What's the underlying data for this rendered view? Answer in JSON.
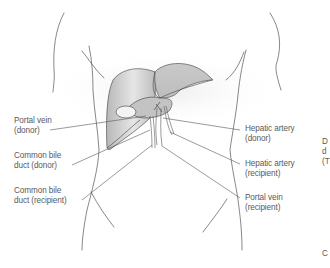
{
  "diagram": {
    "type": "anatomical",
    "colors": {
      "liver_fill": "#bdbdbd",
      "liver_stroke": "#555555",
      "body_outline": "#555555",
      "leader_line": "#555555",
      "text": "#5a5a5a",
      "shadow": "#efefef"
    },
    "labels_left": [
      {
        "line1": "Portal vein",
        "line2": "(donor)"
      },
      {
        "line1": "Common bile",
        "line2": "duct (donor)"
      },
      {
        "line1": "Common bile",
        "line2": "duct (recipient)"
      }
    ],
    "labels_right": [
      {
        "line1": "Hepatic artery",
        "line2": "(donor)"
      },
      {
        "line1": "Hepatic artery",
        "line2": "(recipient)"
      },
      {
        "line1": "Portal vein",
        "line2": "(recipient)"
      }
    ],
    "clipped_right": {
      "line1": "D",
      "line2": "d",
      "line3": "(T",
      "line4": "C"
    }
  }
}
